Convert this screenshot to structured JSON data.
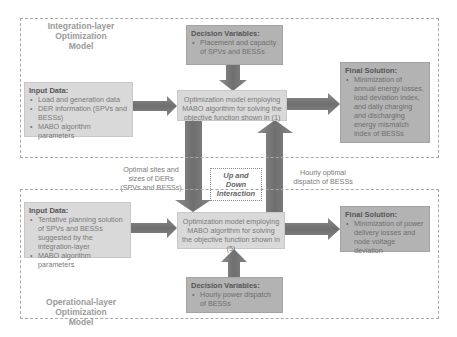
{
  "integration_layer": {
    "title": "Integration-layer Optimization Model",
    "title_line1": "Integration-layer Optimization",
    "title_line2": "Model",
    "decision_variables": {
      "heading": "Decision Variables:",
      "items": [
        "Placement and capacity of SPVs and BESSs"
      ]
    },
    "input_data": {
      "heading": "Input Data:",
      "items": [
        "Load and generation data",
        "DER information (SPVs and BESSs)",
        "MABO algorithm parameters"
      ]
    },
    "optimization_model": "Optimization model employing MABO algorithm for solving the objective function shown in (1)",
    "final_solution": {
      "heading": "Final Solution:",
      "items": [
        "Minimization of annual energy losses, load deviation index, and daily charging and discharging energy mismatch index of BESSs"
      ]
    }
  },
  "interaction": {
    "down_label": "Optimal sites and sizes of DERs (SPVs and BESSs)",
    "up_label": "Hourly optimal dispatch of BESSs",
    "center_label_line1": "Up and Down",
    "center_label_line2": "Interaction"
  },
  "operational_layer": {
    "title_line1": "Operational-layer Optimization",
    "title_line2": "Model",
    "input_data": {
      "heading": "Input Data:",
      "items": [
        "Tentative planning solution of SPVs and BESSs suggested by the integration-layer",
        "MABO algorithm parameters"
      ]
    },
    "optimization_model": "Optimization model employing MABO algorithm for solving the objective function shown in (5)",
    "final_solution": {
      "heading": "Final Solution:",
      "items": [
        "Minimization of power delivery losses and node voltage deviation"
      ]
    },
    "decision_variables": {
      "heading": "Decision Variables:",
      "items": [
        "Hourly power dispatch of BESSs"
      ]
    }
  },
  "colors": {
    "light_box": "#d9d9d9",
    "dark_box": "#b3b3b3",
    "arrow": "#7f7f7f",
    "dashed_border": "#a8a8a8"
  }
}
